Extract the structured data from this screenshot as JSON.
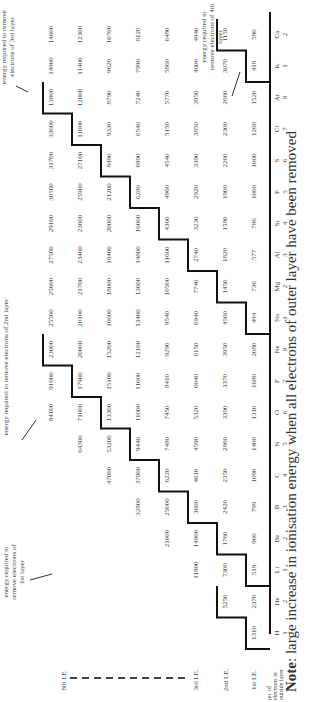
{
  "row_labels": [
    "8th I.E.",
    "3rd I.E.",
    "2nd I.E.",
    "1st I.E.",
    "no. of electrons in outside layer"
  ],
  "elements": [
    {
      "symbol": "H",
      "outer": "1",
      "ie": [
        1310
      ]
    },
    {
      "symbol": "He",
      "outer": "2",
      "ie": [
        2370,
        5250
      ]
    },
    {
      "symbol": "Li",
      "outer": "1",
      "ie": [
        519,
        7300,
        11800
      ]
    },
    {
      "symbol": "Be",
      "outer": "2",
      "ie": [
        900,
        1760,
        14800,
        21000
      ]
    },
    {
      "symbol": "B",
      "outer": "3",
      "ie": [
        799,
        2420,
        3660,
        25000,
        32800
      ]
    },
    {
      "symbol": "C",
      "outer": "4",
      "ie": [
        1090,
        2350,
        4610,
        6220,
        37800,
        47000
      ]
    },
    {
      "symbol": "N",
      "outer": "5",
      "ie": [
        1400,
        2860,
        4590,
        7480,
        9440,
        53200,
        64300
      ]
    },
    {
      "symbol": "O",
      "outer": "6",
      "ie": [
        1310,
        3390,
        5320,
        7450,
        11000,
        13300,
        71000,
        84100
      ]
    },
    {
      "symbol": "F",
      "outer": "7",
      "ie": [
        1680,
        3370,
        6040,
        8410,
        11000,
        15100,
        17900,
        91600
      ]
    },
    {
      "symbol": "Ne",
      "outer": "8",
      "ie": [
        2080,
        3950,
        6150,
        9290,
        12100,
        15200,
        20000,
        23000
      ]
    },
    {
      "symbol": "Na",
      "outer": "1",
      "ie": [
        494,
        4560,
        6940,
        9540,
        13400,
        16600,
        20100,
        25500
      ]
    },
    {
      "symbol": "Mg",
      "outer": "2",
      "ie": [
        736,
        1450,
        7740,
        10500,
        13600,
        18000,
        21700,
        25600
      ]
    },
    {
      "symbol": "Al",
      "outer": "3",
      "ie": [
        577,
        1820,
        2740,
        11600,
        14800,
        18400,
        23400,
        27500
      ]
    },
    {
      "symbol": "Si",
      "outer": "4",
      "ie": [
        786,
        1580,
        3230,
        4360,
        16000,
        20000,
        23600,
        29100
      ]
    },
    {
      "symbol": "P",
      "outer": "5",
      "ie": [
        1060,
        1900,
        2920,
        4960,
        6280,
        21200,
        25900,
        30500
      ]
    },
    {
      "symbol": "S",
      "outer": "6",
      "ie": [
        1000,
        2260,
        3390,
        4540,
        6990,
        8490,
        27100,
        31700
      ]
    },
    {
      "symbol": "Cl",
      "outer": "7",
      "ie": [
        1260,
        2300,
        3850,
        5150,
        6540,
        9330,
        11000,
        33600
      ]
    },
    {
      "symbol": "Ar",
      "outer": "8",
      "ie": [
        1520,
        2660,
        3950,
        5770,
        7240,
        8790,
        12000,
        13800
      ]
    },
    {
      "symbol": "K",
      "outer": "1",
      "ie": [
        418,
        3070,
        4600,
        5860,
        7990,
        9620,
        11400,
        14900
      ]
    },
    {
      "symbol": "Ca",
      "outer": "2",
      "ie": [
        590,
        1150,
        4940,
        6480,
        8120,
        10700,
        12300,
        14600
      ]
    }
  ],
  "annotations": {
    "layer1": "energy required to remove electrons of 1st layer",
    "layer2": "energy required to remove electrons of 2nd layer",
    "layer3": "energy required to remove electrons of 3rd layer",
    "layer4": "energy required to remove electrons of 4th layer"
  },
  "note": {
    "prefix": "Note",
    "text": ": large increase in ionisation energy when all electrons of outer layer have been removed"
  }
}
